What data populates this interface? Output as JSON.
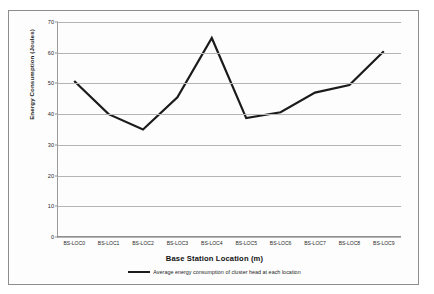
{
  "figure": {
    "frame_color": "#8d8d8d",
    "background": "#fdfdfd"
  },
  "chart_data": {
    "type": "line",
    "title": "",
    "xlabel": "Base Station Location (m)",
    "ylabel": "Energy Consumption (Joules)",
    "categories": [
      "BS-LOC0",
      "BS-LOC1",
      "BS-LOC2",
      "BS-LOC3",
      "BS-LOC4",
      "BS-LOC5",
      "BS-LOC6",
      "BS-LOC7",
      "BS-LOC8",
      "BS-LOC9"
    ],
    "series": [
      {
        "name": "Average energy consumption of cluster head at each location",
        "values": [
          50.8,
          40.0,
          35.0,
          45.5,
          64.8,
          38.7,
          40.6,
          47.0,
          49.5,
          60.5
        ],
        "color": "#1b1b1b",
        "line_width": 2.2
      }
    ],
    "ylim": [
      0,
      70
    ],
    "yticks": [
      0,
      10,
      20,
      30,
      40,
      50,
      60,
      70
    ],
    "ytick_labels": [
      "0",
      "10",
      "20",
      "30",
      "40",
      "50",
      "60",
      "70"
    ],
    "grid": "horizontal",
    "grid_color": "#b4b4b4",
    "legend_position": "bottom"
  },
  "legend": {
    "entries": [
      {
        "label": "Average energy consumption of cluster head at each location",
        "color": "#1b1b1b"
      }
    ]
  }
}
